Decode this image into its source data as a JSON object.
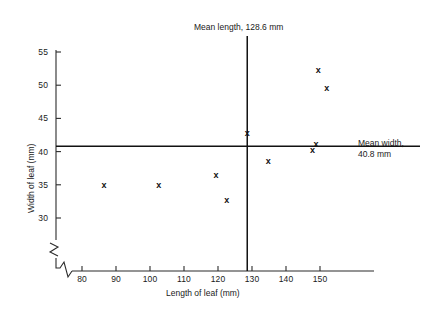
{
  "chart_data": {
    "type": "scatter",
    "title": "",
    "xlabel": "Length of leaf (mm)",
    "ylabel": "Width of leaf (mm)",
    "xlim": [
      74,
      158
    ],
    "ylim": [
      28.5,
      56
    ],
    "xticks": [
      80,
      90,
      100,
      110,
      120,
      130,
      140,
      150
    ],
    "yticks": [
      30,
      35,
      40,
      45,
      50,
      55
    ],
    "xtick_labels": [
      "80",
      "90",
      "100",
      "110",
      "120",
      "130",
      "140",
      "150"
    ],
    "ytick_labels": [
      "30",
      "35",
      "40",
      "45",
      "50",
      "55"
    ],
    "grid": false,
    "legend": "none",
    "axis_break_x": true,
    "axis_break_y": true,
    "marker": "x",
    "points": [
      {
        "x": 86.5,
        "y": 35.0
      },
      {
        "x": 102.6,
        "y": 35.0
      },
      {
        "x": 119.4,
        "y": 36.6
      },
      {
        "x": 122.6,
        "y": 32.7
      },
      {
        "x": 128.6,
        "y": 42.8
      },
      {
        "x": 134.8,
        "y": 38.6
      },
      {
        "x": 147.8,
        "y": 40.3
      },
      {
        "x": 148.8,
        "y": 41.2
      },
      {
        "x": 149.5,
        "y": 52.4
      },
      {
        "x": 152.0,
        "y": 49.6
      }
    ],
    "reference_lines": [
      {
        "orientation": "vertical",
        "value": 128.6,
        "label": "Mean length, 128.6 mm"
      },
      {
        "orientation": "horizontal",
        "value": 40.8,
        "label_line1": "Mean width,",
        "label_line2": "40.8 mm"
      }
    ],
    "colors": {
      "axis": "#2b2b2b",
      "marker": "#111111",
      "mean_line": "#111111",
      "background": "#ffffff"
    }
  },
  "annotations": {
    "mean_length_label": "Mean length, 128.6 mm",
    "mean_width_label_line1": "Mean width,",
    "mean_width_label_line2": "40.8 mm"
  }
}
